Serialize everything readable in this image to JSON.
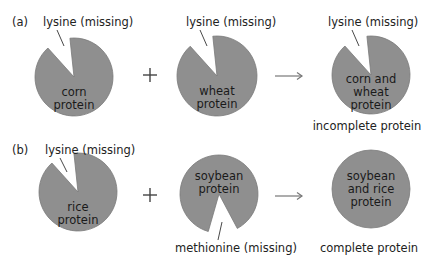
{
  "colors": {
    "pie_fill": "#8f8f8f",
    "pie_stroke": "#7a7a7a",
    "text": "#222222",
    "arrow": "#777777"
  },
  "panels": {
    "a": {
      "label": "(a)",
      "label_pos": [
        12,
        26
      ],
      "operator": "+",
      "operator_pos": [
        150,
        75
      ],
      "arrow": {
        "x1": 275,
        "x2": 302,
        "y": 76
      },
      "pies": [
        {
          "id": "corn",
          "cx": 74,
          "cy": 77,
          "r": 39,
          "missing": [
            -132,
            -96
          ],
          "inner_lines": [
            "corn",
            "protein"
          ],
          "inner_x": 74,
          "inner_y": 96,
          "missing_label": "lysine (missing)",
          "missing_label_pos": [
            43,
            26
          ],
          "leader": [
            57,
            30,
            64,
            46
          ]
        },
        {
          "id": "wheat",
          "cx": 217,
          "cy": 76,
          "r": 40,
          "missing": [
            -132,
            -96
          ],
          "inner_lines": [
            "wheat",
            "protein"
          ],
          "inner_x": 217,
          "inner_y": 95,
          "missing_label": "lysine (missing)",
          "missing_label_pos": [
            186,
            26
          ],
          "leader": [
            200,
            30,
            207,
            46
          ]
        },
        {
          "id": "corn-wheat",
          "cx": 371,
          "cy": 75,
          "r": 39,
          "missing": [
            -132,
            -96
          ],
          "inner_lines": [
            "corn and",
            "wheat",
            "protein"
          ],
          "inner_x": 371,
          "inner_y": 83,
          "missing_label": "lysine (missing)",
          "missing_label_pos": [
            328,
            26
          ],
          "leader": [
            352,
            30,
            359,
            46
          ],
          "caption": "incomplete protein",
          "caption_pos": [
            367,
            130
          ]
        }
      ]
    },
    "b": {
      "label": "(b)",
      "label_pos": [
        12,
        154
      ],
      "operator": "+",
      "operator_pos": [
        150,
        195
      ],
      "arrow": {
        "x1": 275,
        "x2": 302,
        "y": 196
      },
      "pies": [
        {
          "id": "rice",
          "cx": 78,
          "cy": 192,
          "r": 39,
          "missing": [
            -132,
            -96
          ],
          "inner_lines": [
            "rice",
            "protein"
          ],
          "inner_x": 78,
          "inner_y": 211,
          "missing_label": "lysine (missing)",
          "missing_label_pos": [
            45,
            154
          ],
          "leader": [
            60,
            158,
            67,
            172
          ]
        },
        {
          "id": "soybean",
          "cx": 219,
          "cy": 194,
          "r": 39,
          "missing": [
            62,
            106
          ],
          "inner_lines": [
            "soybean",
            "protein"
          ],
          "inner_x": 219,
          "inner_y": 180,
          "missing_label": "methionine (missing)",
          "missing_label_pos": [
            175,
            252
          ],
          "leader": [
            222,
            222,
            218,
            240
          ]
        },
        {
          "id": "soybean-rice",
          "cx": 371,
          "cy": 189,
          "r": 39,
          "missing": null,
          "inner_lines": [
            "soybean",
            "and rice",
            "protein"
          ],
          "inner_x": 371,
          "inner_y": 180,
          "caption": "complete protein",
          "caption_pos": [
            369,
            252
          ]
        }
      ]
    }
  }
}
